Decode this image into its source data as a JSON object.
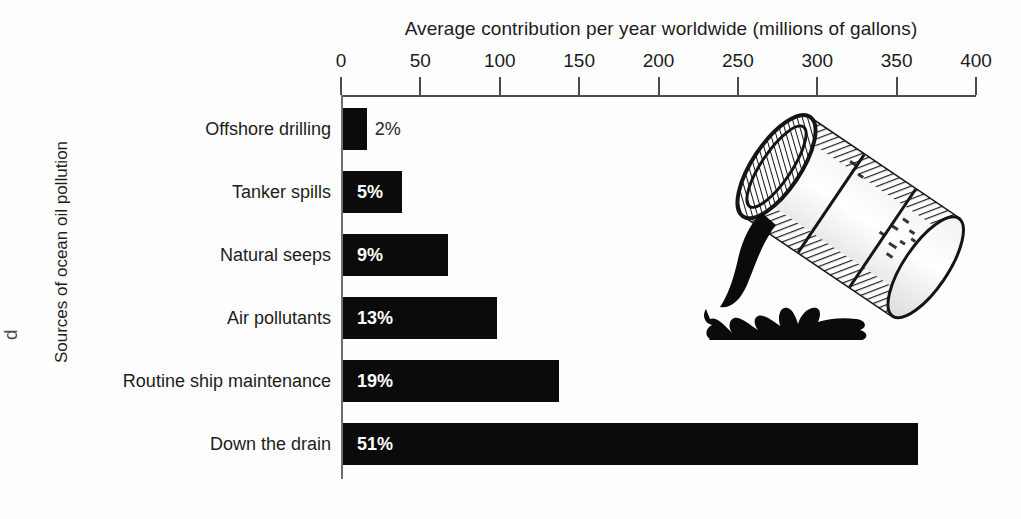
{
  "chart_data": {
    "type": "bar",
    "orientation": "horizontal",
    "title": "Average contribution per year worldwide (millions of gallons)",
    "xlabel": "Average contribution per year worldwide (millions of gallons)",
    "ylabel": "Sources of ocean oil pollution",
    "xlim": [
      0,
      400
    ],
    "grid": false,
    "legend": null,
    "xticks": [
      0,
      50,
      100,
      150,
      200,
      250,
      300,
      350,
      400
    ],
    "xtick_labels": [
      "0",
      "50",
      "100",
      "150",
      "200",
      "250",
      "300",
      "350",
      "400"
    ],
    "categories": [
      "Offshore drilling",
      "Tanker spills",
      "Natural seeps",
      "Air pollutants",
      "Routine ship maintenance",
      "Down the drain"
    ],
    "values": [
      15,
      37,
      66,
      97,
      136,
      362
    ],
    "data_labels": [
      "2%",
      "5%",
      "9%",
      "13%",
      "19%",
      "51%"
    ],
    "percentages": [
      2,
      5,
      9,
      13,
      19,
      51
    ],
    "bars": [
      {
        "category": "Offshore drilling",
        "value": 15,
        "label": "2%",
        "label_position": "outside"
      },
      {
        "category": "Tanker spills",
        "value": 37,
        "label": "5%",
        "label_position": "inside"
      },
      {
        "category": "Natural seeps",
        "value": 66,
        "label": "9%",
        "label_position": "inside"
      },
      {
        "category": "Air pollutants",
        "value": 97,
        "label": "13%",
        "label_position": "inside"
      },
      {
        "category": "Routine ship maintenance",
        "value": 136,
        "label": "19%",
        "label_position": "inside"
      },
      {
        "category": "Down the drain",
        "value": 362,
        "label": "51%",
        "label_position": "inside"
      }
    ]
  },
  "illustration": {
    "name": "tipped-oil-drum-pouring",
    "description": "Tilted hatched oil drum pouring a black stream of oil into a splashing puddle"
  },
  "colors": {
    "bar": "#0b0b0b",
    "background": "#fefefe",
    "axis": "#4b4b4b",
    "text": "#1c1c1c",
    "inside_label": "#ffffff",
    "outside_label": "#262626"
  },
  "page_edge_fragment": "d"
}
